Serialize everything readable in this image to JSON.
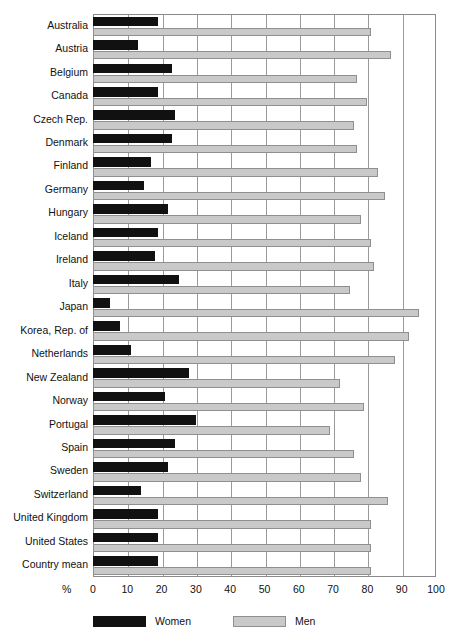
{
  "chart_data": {
    "type": "bar",
    "orientation": "horizontal",
    "title": "",
    "subtitle": "",
    "xlabel": "%",
    "ylabel": "",
    "xlim": [
      0,
      100
    ],
    "xticks": [
      0,
      10,
      20,
      30,
      40,
      50,
      60,
      70,
      80,
      90,
      100
    ],
    "grid": true,
    "grid_axis": "x",
    "legend_position": "bottom-left",
    "categories": [
      "Australia",
      "Austria",
      "Belgium",
      "Canada",
      "Czech Rep.",
      "Denmark",
      "Finland",
      "Germany",
      "Hungary",
      "Iceland",
      "Ireland",
      "Italy",
      "Japan",
      "Korea, Rep. of",
      "Netherlands",
      "New Zealand",
      "Norway",
      "Portugal",
      "Spain",
      "Sweden",
      "Switzerland",
      "United Kingdom",
      "United States",
      "Country mean"
    ],
    "series": [
      {
        "name": "Women",
        "color": "#111111",
        "values": [
          19,
          13,
          23,
          19,
          24,
          23,
          17,
          15,
          22,
          19,
          18,
          25,
          5,
          8,
          11,
          28,
          21,
          30,
          24,
          22,
          14,
          19,
          19,
          19
        ]
      },
      {
        "name": "Men",
        "color": "#c9c9c9",
        "values": [
          81,
          87,
          77,
          80,
          76,
          77,
          83,
          85,
          78,
          81,
          82,
          75,
          95,
          92,
          88,
          72,
          79,
          69,
          76,
          78,
          86,
          81,
          81,
          81
        ]
      }
    ]
  },
  "axis": {
    "percent_symbol": "%"
  },
  "legend": {
    "items": [
      {
        "label": "Women",
        "swatch": "swatch-women"
      },
      {
        "label": "Men",
        "swatch": "swatch-men"
      }
    ]
  },
  "colors": {
    "women": "#111111",
    "men": "#c9c9c9",
    "grid": "#9a9a9a",
    "frame": "#8a8a8a",
    "text": "#111111",
    "background": "#ffffff"
  }
}
